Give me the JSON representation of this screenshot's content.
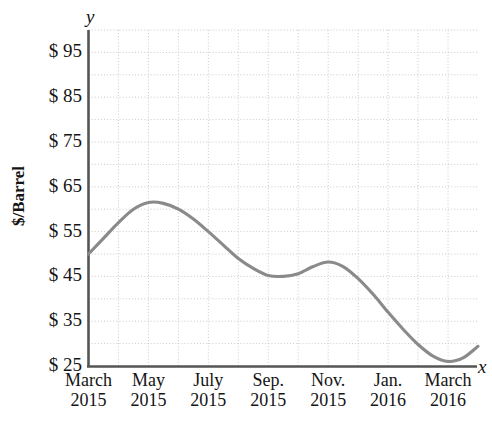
{
  "chart_data": {
    "type": "line",
    "title": "",
    "xlabel": "x",
    "ylabel": "$/Barrel",
    "ylim": [
      25,
      100
    ],
    "xlim": [
      0,
      13
    ],
    "grid": true,
    "grid_step_y": 5,
    "legend": null,
    "axis_letter_x": "x",
    "axis_letter_y": "y",
    "y_ticks": [
      "$ 95",
      "$ 85",
      "$ 75",
      "$ 65",
      "$ 55",
      "$ 45",
      "$ 35",
      "$ 25"
    ],
    "y_tick_values": [
      95,
      85,
      75,
      65,
      55,
      45,
      35,
      25
    ],
    "x_ticks": [
      {
        "month": "March",
        "year": "2015"
      },
      {
        "month": "May",
        "year": "2015"
      },
      {
        "month": "July",
        "year": "2015"
      },
      {
        "month": "Sep.",
        "year": "2015"
      },
      {
        "month": "Nov.",
        "year": "2015"
      },
      {
        "month": "Jan.",
        "year": "2016"
      },
      {
        "month": "March",
        "year": "2016"
      }
    ],
    "x_tick_values": [
      0,
      2,
      4,
      6,
      8,
      10,
      12
    ],
    "series": [
      {
        "name": "Crude oil price",
        "color": "#8a8a8a",
        "x": [
          0.0,
          0.5,
          1.0,
          1.5,
          2.0,
          2.5,
          3.0,
          3.5,
          4.0,
          4.5,
          5.0,
          5.5,
          6.0,
          6.5,
          7.0,
          7.5,
          8.0,
          8.5,
          9.0,
          9.5,
          10.0,
          10.5,
          11.0,
          11.5,
          12.0,
          12.5,
          13.0
        ],
        "values": [
          50.0,
          53.5,
          57.0,
          60.0,
          61.5,
          61.3,
          60.0,
          57.8,
          55.0,
          52.0,
          49.0,
          46.8,
          45.2,
          45.0,
          45.6,
          47.2,
          48.2,
          47.2,
          44.5,
          41.0,
          37.0,
          33.2,
          29.8,
          27.2,
          26.0,
          26.8,
          29.4
        ]
      }
    ],
    "annotations": []
  }
}
